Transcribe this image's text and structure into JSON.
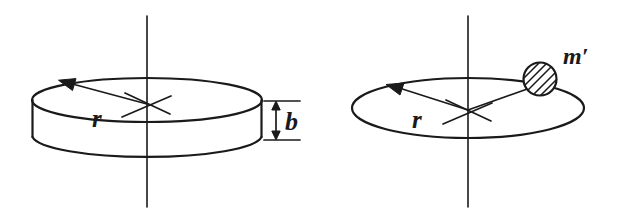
{
  "figure": {
    "background_color": "#ffffff",
    "ink_color": "#1a1a1a",
    "panels": [
      {
        "id": "left-panel",
        "name": "solid-disk-figure",
        "description": "Solid cylindrical disk of radius r and thickness b rotating about a vertical axis",
        "labels": {
          "radius": "r",
          "thickness": "b"
        },
        "elements": [
          "vertical-rotation-axis",
          "disk-top-ellipse",
          "disk-bottom-arc",
          "disk-left-wall",
          "disk-right-wall",
          "radius-arrow",
          "center-cross",
          "thickness-dimension"
        ]
      },
      {
        "id": "right-panel",
        "name": "ring-point-mass-figure",
        "description": "Circular ring of radius r with a hatched point mass m' on the rim, rotating about a vertical axis",
        "labels": {
          "radius": "r",
          "point_mass": "m′"
        },
        "elements": [
          "vertical-rotation-axis",
          "ring-ellipse",
          "radius-arrow",
          "radius-to-mass-line",
          "center-cross",
          "point-mass-circle"
        ]
      }
    ]
  }
}
